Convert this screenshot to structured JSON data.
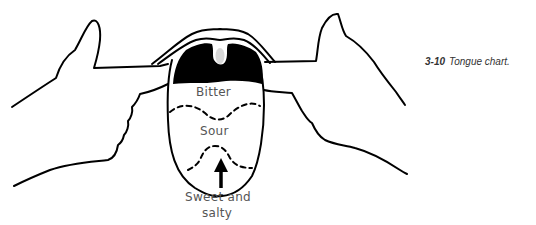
{
  "figure": {
    "number": "3-10",
    "caption": "Tongue chart."
  },
  "regions": [
    {
      "label": "Bitter"
    },
    {
      "label": "Sour"
    },
    {
      "label_line1": "Sweet and",
      "label_line2": "salty"
    }
  ],
  "colors": {
    "line": "#000000",
    "label_text": "#555555",
    "background": "#ffffff"
  }
}
